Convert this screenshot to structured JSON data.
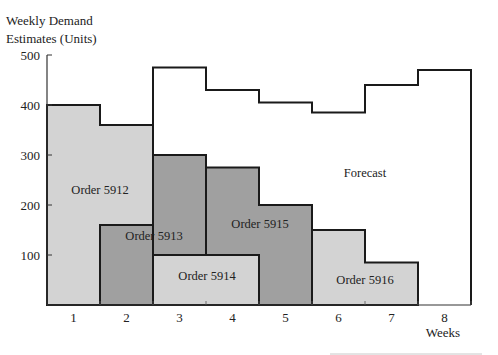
{
  "chart_data": {
    "type": "bar",
    "title": "",
    "ylabel": "Weekly Demand Estimates (Units)",
    "ylabel_lines": [
      "Weekly Demand",
      "Estimates (Units)"
    ],
    "xlabel": "Weeks",
    "ylim": [
      0,
      500
    ],
    "yticks": [
      100,
      200,
      300,
      400,
      500
    ],
    "categories": [
      "1",
      "2",
      "3",
      "4",
      "5",
      "6",
      "7",
      "8"
    ],
    "grid": false,
    "colors": {
      "light": "#d3d3d3",
      "dark": "#a0a0a0",
      "outline": "#1a1a1a"
    },
    "series": [
      {
        "name": "Order 5912",
        "shade": "light",
        "segments": [
          {
            "week": 1,
            "bottom": 0,
            "top": 400
          },
          {
            "week": 2,
            "bottom": 160,
            "top": 360
          }
        ],
        "label_pos": [
          100,
          230
        ]
      },
      {
        "name": "Order 5913",
        "shade": "dark",
        "segments": [
          {
            "week": 2,
            "bottom": 0,
            "top": 160
          },
          {
            "week": 3,
            "bottom": 100,
            "top": 300
          }
        ],
        "label_pos": [
          154,
          138
        ]
      },
      {
        "name": "Order 5914",
        "shade": "light",
        "segments": [
          {
            "week": 3,
            "bottom": 0,
            "top": 100
          },
          {
            "week": 4,
            "bottom": 0,
            "top": 100
          }
        ],
        "label_pos": [
          207,
          58
        ]
      },
      {
        "name": "Order 5915",
        "shade": "dark",
        "segments": [
          {
            "week": 4,
            "bottom": 100,
            "top": 275
          },
          {
            "week": 5,
            "bottom": 0,
            "top": 200
          }
        ],
        "label_pos": [
          260,
          163
        ]
      },
      {
        "name": "Order 5916",
        "shade": "light",
        "segments": [
          {
            "week": 6,
            "bottom": 0,
            "top": 150
          },
          {
            "week": 7,
            "bottom": 0,
            "top": 85
          }
        ],
        "label_pos": [
          365,
          50
        ]
      }
    ],
    "forecast": {
      "name": "Forecast",
      "weeks": [
        3,
        4,
        5,
        6,
        7,
        8
      ],
      "values": [
        475,
        430,
        405,
        385,
        440,
        470
      ],
      "label_pos": [
        365,
        265
      ]
    }
  }
}
